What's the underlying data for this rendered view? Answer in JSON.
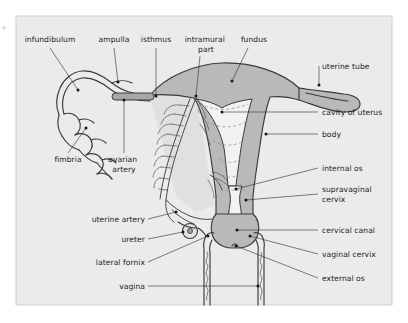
{
  "figure": {
    "panel": {
      "background_color": "#ebebeb",
      "border_color": "#cfcfcf",
      "page_background": "#ffffff"
    },
    "colors": {
      "organ_fill": "#b9b9b9",
      "cavity_fill": "#f2f2f0",
      "outline": "#3a3a3a",
      "leader_line": "#2b2b2b",
      "label_text": "#1c1c1c",
      "dash_line": "#8d8d8d",
      "vessel": "#4a4a4a"
    },
    "labels": [
      {
        "id": "infundibulum",
        "text": "infundibulum",
        "lines": [
          "infundibulum"
        ],
        "side": "top",
        "anchor": "middle"
      },
      {
        "id": "ampulla",
        "text": "ampulla",
        "lines": [
          "ampulla"
        ],
        "side": "top",
        "anchor": "middle"
      },
      {
        "id": "isthmus",
        "text": "isthmus",
        "lines": [
          "isthmus"
        ],
        "side": "top",
        "anchor": "middle"
      },
      {
        "id": "intramural-part",
        "text": "intramural part",
        "lines": [
          "intramural",
          "part"
        ],
        "side": "top",
        "anchor": "middle"
      },
      {
        "id": "fundus",
        "text": "fundus",
        "lines": [
          "fundus"
        ],
        "side": "top",
        "anchor": "middle"
      },
      {
        "id": "uterine-tube",
        "text": "uterine tube",
        "lines": [
          "uterine tube"
        ],
        "side": "right",
        "anchor": "start"
      },
      {
        "id": "cavity-of-uterus",
        "text": "cavity of uterus",
        "lines": [
          "cavity of uterus"
        ],
        "side": "right",
        "anchor": "start"
      },
      {
        "id": "body",
        "text": "body",
        "lines": [
          "body"
        ],
        "side": "right",
        "anchor": "start"
      },
      {
        "id": "internal-os",
        "text": "internal os",
        "lines": [
          "internal os"
        ],
        "side": "right",
        "anchor": "start"
      },
      {
        "id": "supravaginal-cervix",
        "text": "supravaginal cervix",
        "lines": [
          "supravaginal",
          "cervix"
        ],
        "side": "right",
        "anchor": "start"
      },
      {
        "id": "cervical-canal",
        "text": "cervical canal",
        "lines": [
          "cervical canal"
        ],
        "side": "right",
        "anchor": "start"
      },
      {
        "id": "vaginal-cervix",
        "text": "vaginal cervix",
        "lines": [
          "vaginal cervix"
        ],
        "side": "right",
        "anchor": "start"
      },
      {
        "id": "external-os",
        "text": "external os",
        "lines": [
          "external os"
        ],
        "side": "right",
        "anchor": "start"
      },
      {
        "id": "fimbria",
        "text": "fimbria",
        "lines": [
          "fimbria"
        ],
        "side": "bottom",
        "anchor": "middle"
      },
      {
        "id": "ovarian-artery",
        "text": "ovarian artery",
        "lines": [
          "ovarian",
          "artery"
        ],
        "side": "bottom",
        "anchor": "middle"
      },
      {
        "id": "uterine-artery",
        "text": "uterine artery",
        "lines": [
          "uterine artery"
        ],
        "side": "left",
        "anchor": "end"
      },
      {
        "id": "ureter",
        "text": "ureter",
        "lines": [
          "ureter"
        ],
        "side": "left",
        "anchor": "end"
      },
      {
        "id": "lateral-fornix",
        "text": "lateral fornix",
        "lines": [
          "lateral fornix"
        ],
        "side": "left",
        "anchor": "end"
      },
      {
        "id": "vagina",
        "text": "vagina",
        "lines": [
          "vagina"
        ],
        "side": "left",
        "anchor": "end"
      }
    ],
    "structures": [
      {
        "id": "uterus-body",
        "name": "uterus body and fundus"
      },
      {
        "id": "uterine-cavity",
        "name": "cavity of uterus"
      },
      {
        "id": "cervix",
        "name": "cervix"
      },
      {
        "id": "cervical-canal",
        "name": "cervical canal"
      },
      {
        "id": "vagina-wall",
        "name": "vaginal wall"
      },
      {
        "id": "left-uterine-tube",
        "name": "left uterine tube"
      },
      {
        "id": "right-uterine-tube",
        "name": "right uterine tube"
      },
      {
        "id": "fimbriae",
        "name": "fimbriae"
      },
      {
        "id": "ovarian-artery-bar",
        "name": "ovarian artery"
      },
      {
        "id": "broad-ligament-vessels",
        "name": "broad ligament vessels"
      },
      {
        "id": "ureter-circle",
        "name": "ureter cross-section"
      }
    ]
  }
}
